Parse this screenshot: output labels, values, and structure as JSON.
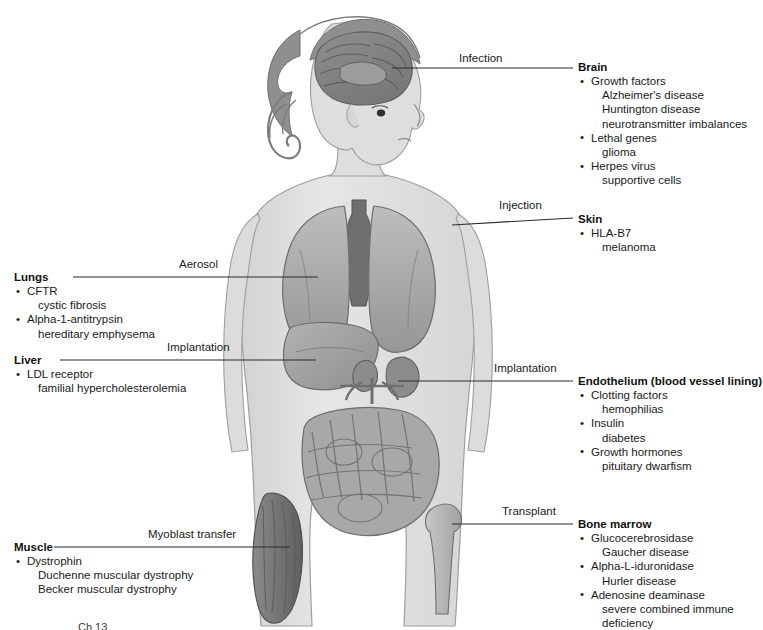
{
  "figure": {
    "caption_partial": "Ch 13"
  },
  "colors": {
    "body_fill": "#e0e0e0",
    "body_outline": "#9a9a9a",
    "organ_mid": "#a8a8a8",
    "organ_dark": "#8a8a8a",
    "organ_darker": "#6f6f6f",
    "hair": "#8f8f8f",
    "muscle": "#747474",
    "leader_line": "#2a2a2a",
    "text": "#1a1a1a",
    "background": "#ffffff"
  },
  "methods": [
    {
      "id": "infection",
      "label": "Infection"
    },
    {
      "id": "injection",
      "label": "Injection"
    },
    {
      "id": "aerosol",
      "label": "Aerosol"
    },
    {
      "id": "implantation-liver",
      "label": "Implantation"
    },
    {
      "id": "implantation-endothelium",
      "label": "Implantation"
    },
    {
      "id": "transplant",
      "label": "Transplant"
    },
    {
      "id": "myoblast-transfer",
      "label": "Myoblast transfer"
    }
  ],
  "callouts": {
    "brain": {
      "title": "Brain",
      "entries": [
        {
          "gene": "Growth factors",
          "diseases": [
            "Alzheimer's disease",
            "Huntington disease",
            "neurotransmitter imbalances"
          ]
        },
        {
          "gene": "Lethal genes",
          "diseases": [
            "glioma"
          ]
        },
        {
          "gene": "Herpes virus",
          "diseases": [
            "supportive cells"
          ]
        }
      ]
    },
    "skin": {
      "title": "Skin",
      "entries": [
        {
          "gene": "HLA-B7",
          "diseases": [
            "melanoma"
          ]
        }
      ]
    },
    "endothelium": {
      "title": "Endothelium (blood vessel lining)",
      "entries": [
        {
          "gene": "Clotting factors",
          "diseases": [
            "hemophilias"
          ]
        },
        {
          "gene": "Insulin",
          "diseases": [
            "diabetes"
          ]
        },
        {
          "gene": "Growth hormones",
          "diseases": [
            "pituitary dwarfism"
          ]
        }
      ]
    },
    "bone_marrow": {
      "title": "Bone marrow",
      "entries": [
        {
          "gene": "Glucocerebrosidase",
          "diseases": [
            "Gaucher disease"
          ]
        },
        {
          "gene": "Alpha-L-iduronidase",
          "diseases": [
            "Hurler disease"
          ]
        },
        {
          "gene": "Adenosine deaminase",
          "diseases": [
            "severe combined immune",
            "deficiency"
          ]
        }
      ]
    },
    "lungs": {
      "title": "Lungs",
      "entries": [
        {
          "gene": "CFTR",
          "diseases": [
            "cystic fibrosis"
          ]
        },
        {
          "gene": "Alpha-1-antitrypsin",
          "diseases": [
            "hereditary emphysema"
          ]
        }
      ]
    },
    "liver": {
      "title": "Liver",
      "entries": [
        {
          "gene": "LDL receptor",
          "diseases": [
            "familial hypercholesterolemia"
          ]
        }
      ]
    },
    "muscle": {
      "title": "Muscle",
      "entries": [
        {
          "gene": "Dystrophin",
          "diseases": [
            "Duchenne muscular dystrophy",
            "Becker muscular dystrophy"
          ]
        }
      ]
    }
  }
}
